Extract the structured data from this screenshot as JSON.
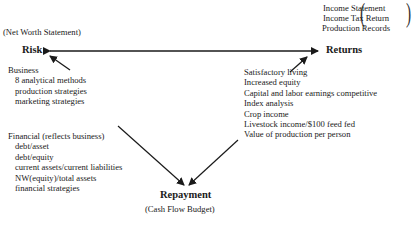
{
  "risk": {
    "label": "Risk",
    "source": "(Net Worth Statement)"
  },
  "returns": {
    "label": "Returns",
    "sources": [
      "Income Statement",
      "Income Tax Return",
      "Production Records"
    ]
  },
  "repayment": {
    "label": "Repayment",
    "source": "(Cash Flow Budget)"
  },
  "business": {
    "heading": "Business",
    "items": [
      "8 analytical methods",
      "production strategies",
      "marketing strategies"
    ]
  },
  "financial": {
    "heading": "Financial (reflects business)",
    "items": [
      "debt/asset",
      "debt/equity",
      "current assets/current liabilities",
      "NW(equity)/total assets",
      "financial strategies"
    ]
  },
  "returns_measures": {
    "items": [
      "Satisfactory living",
      "Increased equity",
      "Capital and labor earnings competitive",
      "Index analysis",
      "Crop income",
      "Livestock income/$100 feed fed",
      "Value of production per person"
    ]
  }
}
